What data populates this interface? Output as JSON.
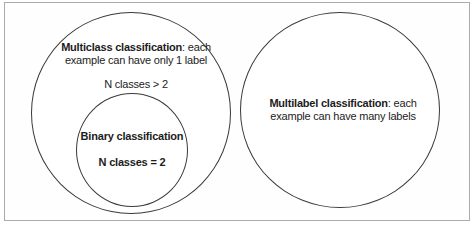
{
  "diagram": {
    "left_circle": {
      "title_bold": "Multiclass classification",
      "title_rest": ": each",
      "title_line2": "example can have only 1 label",
      "annotation": "N classes > 2"
    },
    "binary_circle": {
      "title": "Binary classification",
      "annotation": "N classes = 2"
    },
    "right_circle": {
      "title_bold": "Multilabel classification",
      "title_rest": ": each",
      "title_line2": "example can have many labels"
    },
    "colors": {
      "frame_border": "#ababab",
      "circle_stroke": "#3a3a3a",
      "text": "#1c1c1c",
      "background": "#ffffff"
    }
  }
}
